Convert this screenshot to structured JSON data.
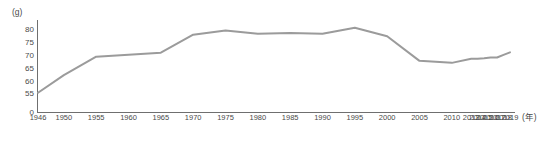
{
  "chart_data": {
    "type": "line",
    "title": "",
    "subtitle": "",
    "xlabel": "(年)",
    "ylabel": "(g)",
    "grid": false,
    "legend": null,
    "xlim": [
      1946,
      2019
    ],
    "ylim": [
      50,
      82.5
    ],
    "y_axis_break": true,
    "y_ticks": [
      "80",
      "75",
      "70",
      "65",
      "60",
      "55",
      "0"
    ],
    "y_tick_values": [
      80,
      75,
      70,
      65,
      60,
      55,
      0
    ],
    "x_ticks": [
      "1946",
      "1950",
      "1955",
      "1960",
      "1965",
      "1970",
      "1975",
      "1980",
      "1985",
      "1990",
      "1995",
      "2000",
      "2005",
      "2010",
      "2013",
      "2014",
      "2015",
      "2016",
      "2017",
      "2018",
      "2019"
    ],
    "x_tick_values": [
      1946,
      1950,
      1955,
      1960,
      1965,
      1970,
      1975,
      1980,
      1985,
      1990,
      1995,
      2000,
      2005,
      2010,
      2013,
      2014,
      2015,
      2016,
      2017,
      2018,
      2019
    ],
    "line_color": "#9b9b9b",
    "axis_color": "#6f6f6f",
    "series": [
      {
        "name": "",
        "x": [
          1946,
          1950,
          1955,
          1960,
          1965,
          1970,
          1975,
          1980,
          1985,
          1990,
          1995,
          2000,
          2005,
          2010,
          2013,
          2014,
          2015,
          2016,
          2017,
          2018,
          2019
        ],
        "values": [
          55.6,
          62.5,
          69.7,
          70.5,
          71.3,
          78.3,
          80.0,
          78.7,
          79.0,
          78.7,
          81.0,
          77.7,
          68.1,
          67.3,
          68.9,
          68.9,
          69.1,
          69.4,
          69.4,
          70.4,
          71.4
        ]
      }
    ]
  },
  "axes": {
    "y_unit_label": "(g)",
    "x_unit_label": "(年)"
  }
}
